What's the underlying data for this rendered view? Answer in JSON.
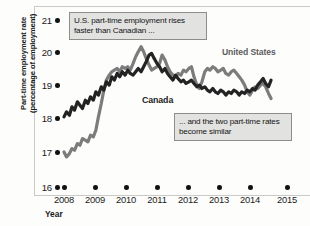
{
  "chart_data": {
    "type": "line",
    "title": "",
    "xlabel": "Year",
    "ylabel": "Part-time employment rate (percentage of employment)",
    "ylabel_line1": "Part-time employment rate",
    "ylabel_line2": "(percentage of employment)",
    "xlim": [
      2008,
      2015
    ],
    "ylim": [
      16,
      21
    ],
    "grid": false,
    "legend_position": "inline-labels",
    "xticks": [
      "2008",
      "2009",
      "2010",
      "2011",
      "2012",
      "2013",
      "2014",
      "2015"
    ],
    "yticks": [
      "16",
      "17",
      "18",
      "19",
      "20",
      "21"
    ],
    "annotations": [
      {
        "name": "top-annotation",
        "text": "U.S. part-time employment rises faster than Canadian ..."
      },
      {
        "name": "bottom-annotation",
        "text": "... and the two part-time rates become similar"
      }
    ],
    "series": [
      {
        "name": "United States",
        "label": "United States",
        "color": "#7c7c7c",
        "x": [
          2008.0,
          2008.08,
          2008.17,
          2008.25,
          2008.33,
          2008.42,
          2008.5,
          2008.58,
          2008.67,
          2008.75,
          2008.83,
          2008.92,
          2009.0,
          2009.08,
          2009.17,
          2009.25,
          2009.33,
          2009.42,
          2009.5,
          2009.58,
          2009.67,
          2009.75,
          2009.83,
          2009.92,
          2010.0,
          2010.08,
          2010.17,
          2010.25,
          2010.33,
          2010.42,
          2010.5,
          2010.58,
          2010.67,
          2010.75,
          2010.83,
          2010.92,
          2011.0,
          2011.08,
          2011.17,
          2011.25,
          2011.33,
          2011.42,
          2011.5,
          2011.58,
          2011.67,
          2011.75,
          2011.83,
          2011.92,
          2012.0,
          2012.08,
          2012.17,
          2012.25,
          2012.33,
          2012.42,
          2012.5,
          2012.58,
          2012.67,
          2012.75,
          2012.83,
          2012.92,
          2013.0,
          2013.08,
          2013.17,
          2013.25,
          2013.33,
          2013.42,
          2013.5,
          2013.58,
          2013.67,
          2013.75,
          2013.83,
          2013.92,
          2014.0,
          2014.08,
          2014.17,
          2014.25,
          2014.33,
          2014.42,
          2014.5
        ],
        "values": [
          17.05,
          16.9,
          17.0,
          17.15,
          17.1,
          17.3,
          17.25,
          17.45,
          17.4,
          17.35,
          17.55,
          17.5,
          17.7,
          18.1,
          18.5,
          18.9,
          19.2,
          19.35,
          19.45,
          19.5,
          19.55,
          19.45,
          19.6,
          19.55,
          19.6,
          19.5,
          19.7,
          19.9,
          20.05,
          20.2,
          20.05,
          19.85,
          19.65,
          19.5,
          19.55,
          19.6,
          19.7,
          19.95,
          19.8,
          19.6,
          19.45,
          19.35,
          19.3,
          19.4,
          19.35,
          19.5,
          19.45,
          19.55,
          19.6,
          19.3,
          19.05,
          18.95,
          19.15,
          19.45,
          19.55,
          19.5,
          19.6,
          19.55,
          19.45,
          19.5,
          19.55,
          19.4,
          19.35,
          19.45,
          19.5,
          19.4,
          19.3,
          19.2,
          19.05,
          18.85,
          18.75,
          18.9,
          19.0,
          18.95,
          19.05,
          19.1,
          19.0,
          18.8,
          18.65
        ]
      },
      {
        "name": "Canada",
        "label": "Canada",
        "color": "#232323",
        "x": [
          2008.0,
          2008.08,
          2008.17,
          2008.25,
          2008.33,
          2008.42,
          2008.5,
          2008.58,
          2008.67,
          2008.75,
          2008.83,
          2008.92,
          2009.0,
          2009.08,
          2009.17,
          2009.25,
          2009.33,
          2009.42,
          2009.5,
          2009.58,
          2009.67,
          2009.75,
          2009.83,
          2009.92,
          2010.0,
          2010.08,
          2010.17,
          2010.25,
          2010.33,
          2010.42,
          2010.5,
          2010.58,
          2010.67,
          2010.75,
          2010.83,
          2010.92,
          2011.0,
          2011.08,
          2011.17,
          2011.25,
          2011.33,
          2011.42,
          2011.5,
          2011.58,
          2011.67,
          2011.75,
          2011.83,
          2011.92,
          2012.0,
          2012.08,
          2012.17,
          2012.25,
          2012.33,
          2012.42,
          2012.5,
          2012.58,
          2012.67,
          2012.75,
          2012.83,
          2012.92,
          2013.0,
          2013.08,
          2013.17,
          2013.25,
          2013.33,
          2013.42,
          2013.5,
          2013.58,
          2013.67,
          2013.75,
          2013.83,
          2013.92,
          2014.0,
          2014.08,
          2014.17,
          2014.25,
          2014.33,
          2014.42,
          2014.5
        ],
        "values": [
          18.1,
          18.25,
          18.15,
          18.4,
          18.3,
          18.55,
          18.45,
          18.35,
          18.6,
          18.5,
          18.7,
          18.6,
          18.85,
          18.75,
          19.0,
          18.9,
          19.15,
          19.05,
          19.3,
          19.2,
          19.4,
          19.3,
          19.45,
          19.35,
          19.5,
          19.4,
          19.35,
          19.45,
          19.55,
          19.45,
          19.6,
          19.75,
          19.95,
          20.0,
          19.85,
          19.7,
          19.6,
          19.45,
          19.55,
          19.4,
          19.3,
          19.2,
          19.35,
          19.25,
          19.15,
          19.2,
          19.1,
          19.15,
          19.2,
          19.1,
          19.0,
          19.05,
          18.95,
          19.0,
          18.9,
          18.85,
          18.95,
          18.85,
          18.8,
          18.9,
          18.85,
          18.75,
          18.85,
          18.8,
          18.9,
          18.85,
          18.75,
          18.85,
          18.8,
          18.9,
          18.85,
          18.95,
          18.9,
          19.05,
          19.15,
          19.25,
          19.1,
          19.0,
          19.2
        ]
      }
    ]
  },
  "axis": {
    "ytick_labels": [
      "21",
      "20",
      "19",
      "18",
      "17",
      "16"
    ],
    "xtick_labels": [
      "2008",
      "2009",
      "2010",
      "2011",
      "2012",
      "2013",
      "2014",
      "2015"
    ],
    "x_axis_title": "Year",
    "y_axis_title_line1": "Part-time employment rate",
    "y_axis_title_line2": "(percentage of employment)"
  },
  "annotations": {
    "top": "U.S. part-time employment rises faster than Canadian ...",
    "bottom": "... and the two part-time rates become similar"
  },
  "labels": {
    "united_states": "United States",
    "canada": "Canada"
  },
  "colors": {
    "united_states": "#7c7c7c",
    "canada": "#232323",
    "annotation_fill": "#e2e2e0",
    "annotation_border": "#8d8d8a",
    "frame": "#c9c9c6",
    "background": "#fdfdfc"
  }
}
